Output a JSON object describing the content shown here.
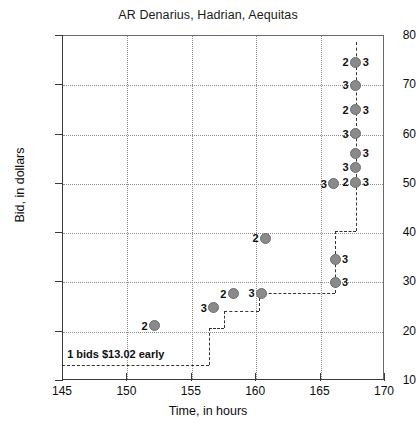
{
  "chart_data": {
    "type": "scatter",
    "title": "AR Denarius, Hadrian, Aequitas",
    "xlabel": "Time, in hours",
    "ylabel": "Bid, in dollars",
    "xlim": [
      145,
      170
    ],
    "ylim": [
      10,
      80
    ],
    "xticks": [
      145,
      150,
      155,
      160,
      165,
      170
    ],
    "yticks": [
      10,
      20,
      30,
      40,
      50,
      60,
      70,
      80
    ],
    "grid": true,
    "legend": "none",
    "annotation": "1 bids $13.02 early",
    "points": [
      {
        "x": 152.2,
        "y": 21.0,
        "left_label": "2",
        "right_label": ""
      },
      {
        "x": 156.8,
        "y": 24.7,
        "left_label": "3",
        "right_label": ""
      },
      {
        "x": 158.3,
        "y": 27.5,
        "left_label": "2",
        "right_label": ""
      },
      {
        "x": 160.5,
        "y": 27.6,
        "left_label": "3",
        "right_label": ""
      },
      {
        "x": 160.8,
        "y": 38.8,
        "left_label": "2",
        "right_label": ""
      },
      {
        "x": 166.2,
        "y": 29.8,
        "left_label": "",
        "right_label": "3"
      },
      {
        "x": 166.2,
        "y": 34.5,
        "left_label": "",
        "right_label": "3"
      },
      {
        "x": 166.1,
        "y": 49.8,
        "left_label": "3",
        "right_label": ""
      },
      {
        "x": 167.8,
        "y": 50.1,
        "left_label": "2",
        "right_label": "3"
      },
      {
        "x": 167.8,
        "y": 53.2,
        "left_label": "3",
        "right_label": ""
      },
      {
        "x": 167.8,
        "y": 56.0,
        "left_label": "",
        "right_label": "3"
      },
      {
        "x": 167.8,
        "y": 60.0,
        "left_label": "3",
        "right_label": ""
      },
      {
        "x": 167.8,
        "y": 64.8,
        "left_label": "2",
        "right_label": "3"
      },
      {
        "x": 167.8,
        "y": 69.8,
        "left_label": "3",
        "right_label": ""
      },
      {
        "x": 167.8,
        "y": 74.5,
        "left_label": "2",
        "right_label": "3"
      }
    ],
    "step_line": [
      {
        "x": 145.0,
        "y": 13.02
      },
      {
        "x": 156.4,
        "y": 13.02
      },
      {
        "x": 156.4,
        "y": 20.5
      },
      {
        "x": 157.6,
        "y": 20.5
      },
      {
        "x": 157.6,
        "y": 24.1
      },
      {
        "x": 160.3,
        "y": 24.1
      },
      {
        "x": 160.3,
        "y": 27.6
      },
      {
        "x": 166.2,
        "y": 27.6
      },
      {
        "x": 166.2,
        "y": 34.5
      },
      {
        "x": 166.2,
        "y": 40.3
      },
      {
        "x": 167.8,
        "y": 40.3
      },
      {
        "x": 167.8,
        "y": 50.1
      },
      {
        "x": 167.8,
        "y": 74.5
      },
      {
        "x": 167.8,
        "y": 78.5
      }
    ]
  }
}
